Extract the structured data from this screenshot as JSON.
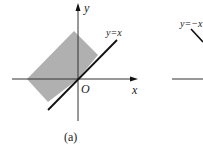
{
  "figure_a": {
    "caption": "(a)",
    "axis_x_label": "x",
    "axis_y_label": "y",
    "origin_label": "O",
    "line_label": "y=x",
    "region_color": "#b0b0b0"
  },
  "figure_b": {
    "line_label": "y=−x"
  }
}
